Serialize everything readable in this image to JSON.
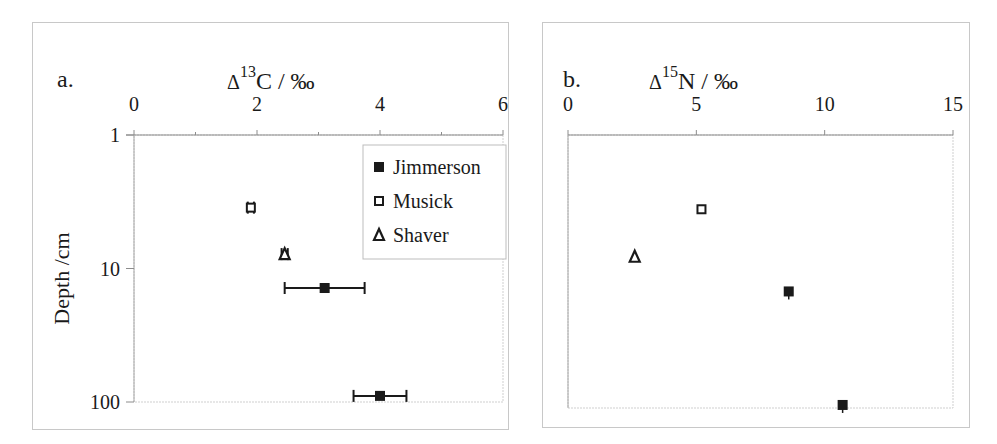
{
  "chart_data": [
    {
      "type": "scatter",
      "panel_label": "a.",
      "title": "Δ¹³C / ‰",
      "title_parts": {
        "delta": "Δ",
        "superscript": "13",
        "element": "C / ‰"
      },
      "xlabel": "Δ¹³C / ‰",
      "ylabel": "Depth /cm",
      "x_axis_position": "top",
      "xlim": [
        0,
        6
      ],
      "x_ticks": [
        "0",
        "2",
        "4",
        "6"
      ],
      "x_minor_ticks": [
        1,
        3,
        5
      ],
      "y_scale": "log",
      "y_inverted": true,
      "ylim": [
        1,
        100
      ],
      "y_ticks": [
        "1",
        "10",
        "100"
      ],
      "grid": false,
      "legend": {
        "position": "upper-right-inside",
        "entries": [
          {
            "name": "Jimmerson",
            "marker": "filled-square"
          },
          {
            "name": "Musick",
            "marker": "open-square"
          },
          {
            "name": "Shaver",
            "marker": "open-triangle"
          }
        ]
      },
      "series": [
        {
          "name": "Jimmerson",
          "marker": "filled-square",
          "points": [
            {
              "x": 3.1,
              "y": 14,
              "x_err": 0.65
            },
            {
              "x": 4.0,
              "y": 90,
              "x_err": 0.43
            }
          ]
        },
        {
          "name": "Musick",
          "marker": "open-square",
          "points": [
            {
              "x": 1.9,
              "y": 3.5,
              "x_err": 0.05
            }
          ]
        },
        {
          "name": "Shaver",
          "marker": "open-triangle",
          "points": [
            {
              "x": 2.45,
              "y": 7.8,
              "x_err": 0.05
            }
          ]
        }
      ]
    },
    {
      "type": "scatter",
      "panel_label": "b.",
      "title": "Δ¹⁵N / ‰",
      "title_parts": {
        "delta": "Δ",
        "superscript": "15",
        "element": "N / ‰"
      },
      "xlabel": "Δ¹⁵N / ‰",
      "ylabel": "",
      "x_axis_position": "top",
      "xlim": [
        0,
        15
      ],
      "x_ticks": [
        "0",
        "5",
        "10",
        "15"
      ],
      "y_scale": "log",
      "y_inverted": true,
      "ylim": [
        1,
        100
      ],
      "y_ticks": [],
      "grid": false,
      "series": [
        {
          "name": "Jimmerson",
          "marker": "filled-square",
          "points": [
            {
              "x": 8.6,
              "y": 14,
              "y_err_small": true
            },
            {
              "x": 10.7,
              "y": 95,
              "y_err_small": true
            }
          ]
        },
        {
          "name": "Musick",
          "marker": "open-square",
          "points": [
            {
              "x": 5.2,
              "y": 3.5
            }
          ]
        },
        {
          "name": "Shaver",
          "marker": "open-triangle",
          "points": [
            {
              "x": 2.6,
              "y": 7.8
            }
          ]
        }
      ]
    }
  ],
  "colors": {
    "marker": "#1a1a1a",
    "axis": "#8c8c8c",
    "frame": "#c8c8c8"
  }
}
